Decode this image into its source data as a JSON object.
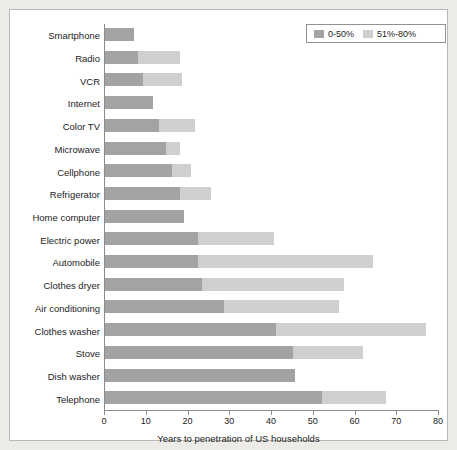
{
  "chart_data": {
    "type": "bar",
    "orientation": "horizontal",
    "stacked": true,
    "title": "",
    "xlabel": "Years to penetration of US households",
    "ylabel": "",
    "xlim": [
      0,
      80
    ],
    "xticks": [
      0,
      10,
      20,
      30,
      40,
      50,
      60,
      70,
      80
    ],
    "xtick_labels": [
      "0",
      "10",
      "20",
      "30",
      "40",
      "50",
      "60",
      "70",
      "80"
    ],
    "grid": false,
    "legend_position": "top-right",
    "categories": [
      "Smartphone",
      "Radio",
      "VCR",
      "Internet",
      "Color TV",
      "Microwave",
      "Cellphone",
      "Refrigerator",
      "Home computer",
      "Electric power",
      "Automobile",
      "Clothes dryer",
      "Air conditioning",
      "Clothes washer",
      "Stove",
      "Dish washer",
      "Telephone"
    ],
    "series": [
      {
        "name": "0-50%",
        "color": "#a3a3a3",
        "values": [
          7,
          8,
          9,
          11.5,
          13,
          14.5,
          16,
          18,
          19,
          22.3,
          22.3,
          23.3,
          28.6,
          41,
          45,
          45.6,
          52
        ]
      },
      {
        "name": "51%-80%",
        "color": "#cfcfcf",
        "values": [
          0,
          10,
          9.5,
          0,
          8.5,
          3.5,
          4.5,
          7.5,
          0,
          18.3,
          41.8,
          33.9,
          27.4,
          35.9,
          16.7,
          0,
          15.3
        ]
      }
    ],
    "totals": [
      7,
      18,
      18.5,
      11.5,
      21.5,
      18,
      20.5,
      25.5,
      19,
      40.6,
      64.1,
      57.2,
      56,
      76.9,
      61.7,
      45.6,
      67.3
    ]
  },
  "legend": {
    "entries": [
      {
        "label": "0-50%",
        "color": "#a3a3a3"
      },
      {
        "label": "51%-80%",
        "color": "#cfcfcf"
      }
    ]
  },
  "colors": {
    "series_a": "#a3a3a3",
    "series_b": "#cfcfcf",
    "background": "#edebe7",
    "plot_background": "#ffffff",
    "axis": "#8c8c8c",
    "text": "#1d1d1d"
  }
}
